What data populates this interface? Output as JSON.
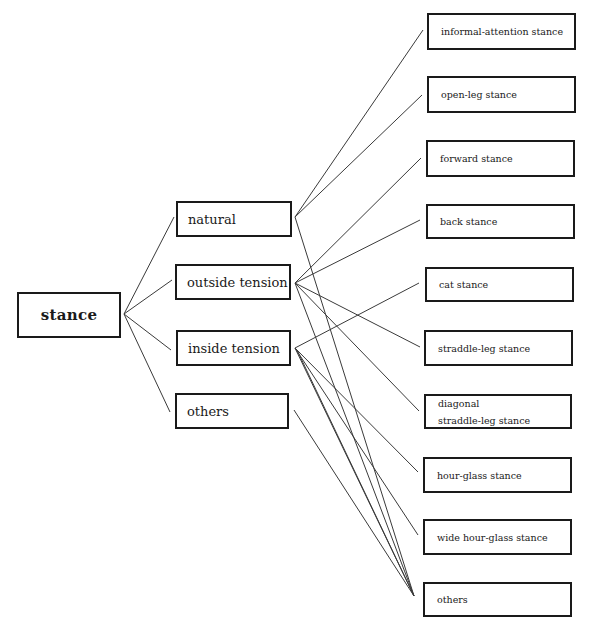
{
  "diagram": {
    "root": {
      "label": "stance"
    },
    "categories": [
      {
        "id": "natural",
        "label": "natural"
      },
      {
        "id": "outside",
        "label": "outside tension"
      },
      {
        "id": "inside",
        "label": "inside tension"
      },
      {
        "id": "others",
        "label": "others"
      }
    ],
    "stances": [
      {
        "id": "informal",
        "label": "informal-attention stance"
      },
      {
        "id": "openleg",
        "label": "open-leg stance"
      },
      {
        "id": "forward",
        "label": "forward stance"
      },
      {
        "id": "back",
        "label": "back stance"
      },
      {
        "id": "cat",
        "label": "cat stance"
      },
      {
        "id": "straddle",
        "label": "straddle-leg stance"
      },
      {
        "id": "diagonal",
        "label_line1": "diagonal",
        "label_line2": "straddle-leg stance"
      },
      {
        "id": "hourglass",
        "label": "hour-glass stance"
      },
      {
        "id": "widehourglass",
        "label": "wide hour-glass stance"
      },
      {
        "id": "others2",
        "label": "others"
      }
    ],
    "edges": [
      [
        "stance",
        "natural"
      ],
      [
        "stance",
        "outside"
      ],
      [
        "stance",
        "inside"
      ],
      [
        "stance",
        "others"
      ],
      [
        "natural",
        "informal"
      ],
      [
        "natural",
        "openleg"
      ],
      [
        "natural",
        "others2"
      ],
      [
        "outside",
        "forward"
      ],
      [
        "outside",
        "back"
      ],
      [
        "outside",
        "straddle"
      ],
      [
        "outside",
        "diagonal"
      ],
      [
        "outside",
        "others2"
      ],
      [
        "inside",
        "cat"
      ],
      [
        "inside",
        "hourglass"
      ],
      [
        "inside",
        "widehourglass"
      ],
      [
        "inside",
        "others2"
      ],
      [
        "others",
        "others2"
      ]
    ]
  }
}
